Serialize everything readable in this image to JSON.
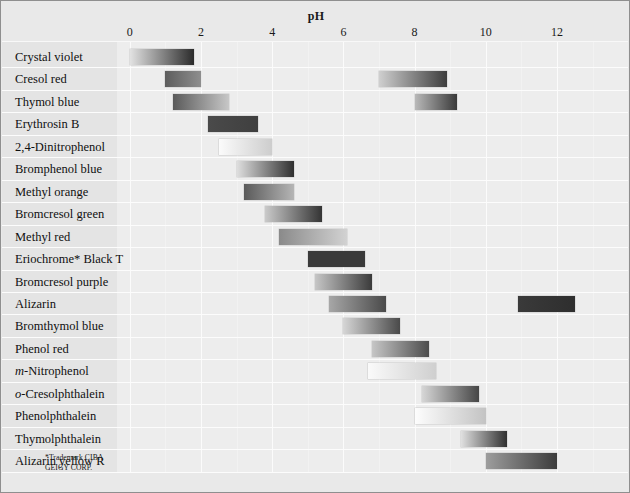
{
  "chart_data": {
    "type": "bar",
    "title": "pH",
    "xlabel": "pH",
    "ylabel": "",
    "xlim": [
      -0.7,
      13.4
    ],
    "xticks": [
      0,
      2,
      4,
      6,
      8,
      10,
      12
    ],
    "xtick_labels": [
      "0",
      "2",
      "4",
      "6",
      "8",
      "10",
      "12"
    ],
    "minor_ticks": [
      1,
      3,
      5,
      7,
      9,
      11,
      13
    ],
    "grid": true,
    "legend": "none",
    "orientation": "horizontal",
    "note": "Acid-base indicators and their pH transition ranges; each bar is a colour-transition gradient band.",
    "categories": [
      "Crystal violet",
      "Cresol red",
      "Thymol blue",
      "Erythrosin B",
      "2,4-Dinitrophenol",
      "Bromphenol blue",
      "Methyl orange",
      "Bromcresol green",
      "Methyl red",
      "Eriochrome* Black T",
      "Bromcresol purple",
      "Alizarin",
      "Bromthymol blue",
      "Phenol red",
      "m-Nitrophenol",
      "o-Cresolphthalein",
      "Phenolphthalein",
      "Thymolphthalein",
      "Alizarin yellow R"
    ],
    "rows": [
      {
        "label": "Crystal violet",
        "label_prefix": "",
        "bands": [
          {
            "start": 0.0,
            "end": 1.8,
            "from": "#e2e2e2",
            "to": "#2b2b2b"
          }
        ]
      },
      {
        "label": "Cresol red",
        "label_prefix": "",
        "bands": [
          {
            "start": 1.0,
            "end": 2.0,
            "from": "#5d5d5d",
            "to": "#8e8e8e"
          },
          {
            "start": 7.0,
            "end": 8.9,
            "from": "#cfcfcf",
            "to": "#3c3c3c"
          }
        ]
      },
      {
        "label": "Thymol blue",
        "label_prefix": "",
        "bands": [
          {
            "start": 1.2,
            "end": 2.8,
            "from": "#5a5a5a",
            "to": "#c7c7c7"
          },
          {
            "start": 8.0,
            "end": 9.2,
            "from": "#b9b9b9",
            "to": "#3a3a3a"
          }
        ]
      },
      {
        "label": "Erythrosin B",
        "label_prefix": "",
        "bands": [
          {
            "start": 2.2,
            "end": 3.6,
            "from": "#4a4a4a",
            "to": "#3f3f3f"
          }
        ]
      },
      {
        "label": "2,4-Dinitrophenol",
        "label_prefix": "",
        "bands": [
          {
            "start": 2.5,
            "end": 4.0,
            "from": "#fbfbfb",
            "to": "#cdcdcd"
          }
        ]
      },
      {
        "label": "Bromphenol blue",
        "label_prefix": "",
        "bands": [
          {
            "start": 3.0,
            "end": 4.6,
            "from": "#dedede",
            "to": "#2f2f2f"
          }
        ]
      },
      {
        "label": "Methyl orange",
        "label_prefix": "",
        "bands": [
          {
            "start": 3.2,
            "end": 4.6,
            "from": "#5a5a5a",
            "to": "#b5b5b5"
          }
        ]
      },
      {
        "label": "Bromcresol green",
        "label_prefix": "",
        "bands": [
          {
            "start": 3.8,
            "end": 5.4,
            "from": "#cacaca",
            "to": "#343434"
          }
        ]
      },
      {
        "label": "Methyl red",
        "label_prefix": "",
        "bands": [
          {
            "start": 4.2,
            "end": 6.1,
            "from": "#8a8a8a",
            "to": "#d2d2d2"
          }
        ]
      },
      {
        "label": "Eriochrome* Black T",
        "label_prefix": "",
        "bands": [
          {
            "start": 5.0,
            "end": 6.6,
            "from": "#3a3a3a",
            "to": "#3a3a3a"
          }
        ]
      },
      {
        "label": "Bromcresol purple",
        "label_prefix": "",
        "bands": [
          {
            "start": 5.2,
            "end": 6.8,
            "from": "#c6c6c6",
            "to": "#3b3b3b"
          }
        ]
      },
      {
        "label": "Alizarin",
        "label_prefix": "",
        "bands": [
          {
            "start": 5.6,
            "end": 7.2,
            "from": "#a7a7a7",
            "to": "#4a4a4a"
          },
          {
            "start": 10.9,
            "end": 12.5,
            "from": "#3a3a3a",
            "to": "#2e2e2e"
          }
        ]
      },
      {
        "label": "Bromthymol blue",
        "label_prefix": "",
        "bands": [
          {
            "start": 6.0,
            "end": 7.6,
            "from": "#d6d6d6",
            "to": "#4a4a4a"
          }
        ]
      },
      {
        "label": "Phenol red",
        "label_prefix": "",
        "bands": [
          {
            "start": 6.8,
            "end": 8.4,
            "from": "#c6c6c6",
            "to": "#4c4c4c"
          }
        ]
      },
      {
        "label": "Nitrophenol",
        "label_prefix": "m-",
        "bands": [
          {
            "start": 6.7,
            "end": 8.6,
            "from": "#fafafa",
            "to": "#cfcfcf"
          }
        ]
      },
      {
        "label": "Cresolphthalein",
        "label_prefix": "o-",
        "bands": [
          {
            "start": 8.2,
            "end": 9.8,
            "from": "#d6d6d6",
            "to": "#464646"
          }
        ]
      },
      {
        "label": "Phenolphthalein",
        "label_prefix": "",
        "bands": [
          {
            "start": 8.0,
            "end": 10.0,
            "from": "#fdfdfd",
            "to": "#c3c3c3"
          }
        ]
      },
      {
        "label": "Thymolphthalein",
        "label_prefix": "",
        "bands": [
          {
            "start": 9.3,
            "end": 10.6,
            "from": "#e0e0e0",
            "to": "#303030"
          }
        ]
      },
      {
        "label": "Alizarin yellow R",
        "label_prefix": "",
        "bands": [
          {
            "start": 10.0,
            "end": 12.0,
            "from": "#9d9d9d",
            "to": "#3c3c3c"
          }
        ]
      }
    ]
  },
  "footnote": {
    "line1": "*Trademark CIBA",
    "line2": "GEIGY CORP."
  },
  "colors": {
    "frame": "#8f8f8f",
    "plot_background": "#ededed",
    "label_background": "#e4e4e4",
    "gridline": "#fbfbfb",
    "text": "#101010"
  }
}
